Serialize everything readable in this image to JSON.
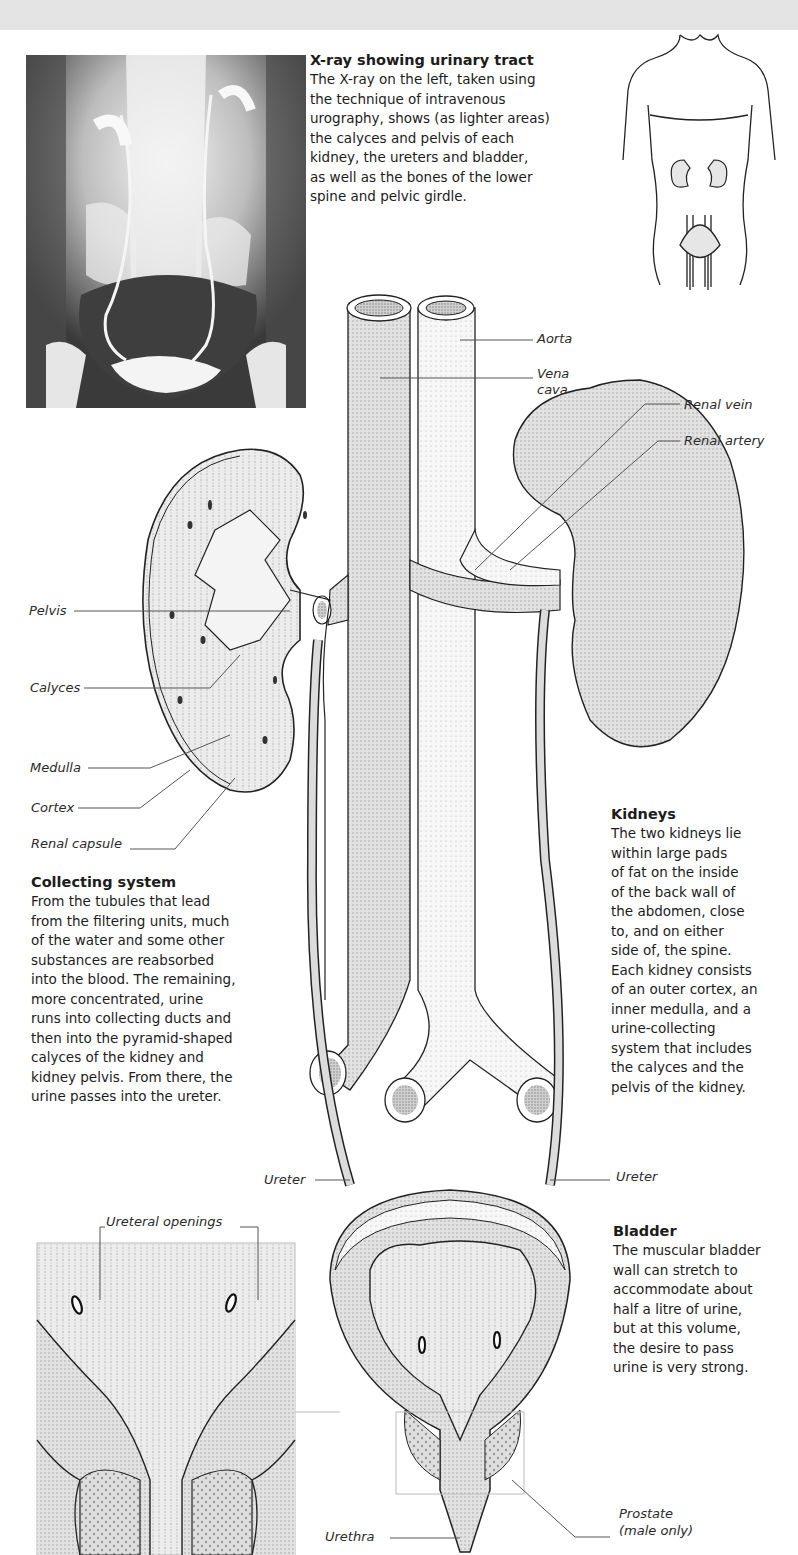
{
  "xray_section": {
    "heading": "X-ray showing urinary tract",
    "lines": [
      "The X-ray on the left, taken using",
      "the technique of intravenous",
      "urography, shows (as lighter areas)",
      "the calyces and pelvis of each",
      "kidney, the ureters and bladder,",
      "as well as the bones of the lower",
      "spine and pelvic girdle."
    ]
  },
  "collecting_section": {
    "heading": "Collecting system",
    "lines": [
      "From the tubules that lead",
      "from the filtering units, much",
      "of the water and some other",
      "substances are reabsorbed",
      "into the blood. The remaining,",
      "more concentrated, urine",
      "runs into collecting ducts and",
      "then into the pyramid-shaped",
      "calyces of the kidney and",
      "kidney pelvis. From there, the",
      "urine passes into the ureter."
    ]
  },
  "kidneys_section": {
    "heading": "Kidneys",
    "lines": [
      "The two kidneys lie",
      "within large pads",
      "of fat on the inside",
      "of the back wall of",
      "the abdomen, close",
      "to, and on either",
      "side of, the spine.",
      "Each kidney consists",
      "of an outer cortex, an",
      "inner medulla, and a",
      "urine-collecting",
      "system that includes",
      "the calyces and the",
      "pelvis of the kidney."
    ]
  },
  "bladder_section": {
    "heading": "Bladder",
    "lines": [
      "The muscular bladder",
      "wall can stretch to",
      "accommodate about",
      "half a litre of urine,",
      "but at this volume,",
      "the desire to pass",
      "urine is very strong."
    ]
  },
  "labels": {
    "aorta": "Aorta",
    "vena_cava_1": "Vena",
    "vena_cava_2": "cava",
    "renal_vein": "Renal vein",
    "renal_artery": "Renal artery",
    "pelvis": "Pelvis",
    "calyces": "Calyces",
    "medulla": "Medulla",
    "cortex": "Cortex",
    "renal_capsule": "Renal capsule",
    "ureter_left": "Ureter",
    "ureter_right": "Ureter",
    "ureteral_openings": "Ureteral openings",
    "urethra": "Urethra",
    "prostate_1": "Prostate",
    "prostate_2": "(male only)"
  },
  "colors": {
    "tissue_fill": "#dcdcdc",
    "vessel_fill": "#d6d6d6",
    "line": "#222222",
    "leader": "#555555",
    "band": "#e4e4e4"
  }
}
